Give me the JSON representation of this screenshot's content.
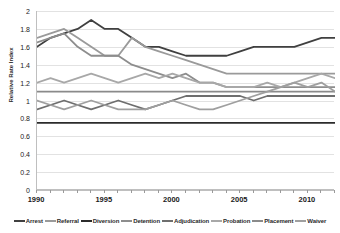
{
  "chart_data": {
    "type": "line",
    "title": "",
    "xlabel": "",
    "ylabel": "Relative Rate Index",
    "ylim": [
      0,
      2
    ],
    "xlim": [
      1990,
      2012
    ],
    "grid": true,
    "legend_position": "bottom",
    "y_ticks": [
      "0",
      "0.2",
      "0.4",
      "0.6",
      "0.8",
      "1",
      "1.2",
      "1.4",
      "1.6",
      "1.8",
      "2"
    ],
    "y_tick_values": [
      0,
      0.2,
      0.4,
      0.6,
      0.8,
      1,
      1.2,
      1.4,
      1.6,
      1.8,
      2
    ],
    "x_ticks": [
      "1990",
      "1995",
      "2000",
      "2005",
      "2010"
    ],
    "x_tick_values": [
      1990,
      1995,
      2000,
      2005,
      2010
    ],
    "x": [
      1990,
      1991,
      1992,
      1993,
      1994,
      1995,
      1996,
      1997,
      1998,
      1999,
      2000,
      2001,
      2002,
      2003,
      2004,
      2005,
      2006,
      2007,
      2008,
      2009,
      2010,
      2011,
      2012
    ],
    "series": [
      {
        "name": "Arrest",
        "color": "#404040",
        "values": [
          1.6,
          1.7,
          1.75,
          1.8,
          1.9,
          1.8,
          1.8,
          1.7,
          1.6,
          1.6,
          1.55,
          1.5,
          1.5,
          1.5,
          1.5,
          1.55,
          1.6,
          1.6,
          1.6,
          1.6,
          1.65,
          1.7,
          1.7
        ]
      },
      {
        "name": "Referral",
        "color": "#9a9a9a",
        "values": [
          1.7,
          1.75,
          1.8,
          1.7,
          1.6,
          1.5,
          1.5,
          1.7,
          1.6,
          1.55,
          1.5,
          1.45,
          1.4,
          1.35,
          1.3,
          1.3,
          1.3,
          1.3,
          1.3,
          1.3,
          1.3,
          1.3,
          1.3
        ]
      },
      {
        "name": "Diversion",
        "color": "#2b2b2b",
        "values": [
          0.75,
          0.75,
          0.75,
          0.75,
          0.75,
          0.75,
          0.75,
          0.75,
          0.75,
          0.75,
          0.75,
          0.75,
          0.75,
          0.75,
          0.75,
          0.75,
          0.75,
          0.75,
          0.75,
          0.75,
          0.75,
          0.75,
          0.75
        ]
      },
      {
        "name": "Detention",
        "color": "#8d8d8d",
        "values": [
          1.65,
          1.7,
          1.75,
          1.6,
          1.5,
          1.5,
          1.5,
          1.4,
          1.35,
          1.3,
          1.25,
          1.3,
          1.2,
          1.2,
          1.15,
          1.15,
          1.15,
          1.15,
          1.15,
          1.15,
          1.15,
          1.15,
          1.15
        ]
      },
      {
        "name": "Adjudication",
        "color": "#6e6e6e",
        "values": [
          0.9,
          0.95,
          1.0,
          0.95,
          0.9,
          0.95,
          1.0,
          0.95,
          0.9,
          0.95,
          1.0,
          1.05,
          1.05,
          1.05,
          1.05,
          1.05,
          1.0,
          1.05,
          1.05,
          1.05,
          1.05,
          1.05,
          1.05
        ]
      },
      {
        "name": "Probation",
        "color": "#a8a8a8",
        "values": [
          1.2,
          1.25,
          1.2,
          1.25,
          1.3,
          1.25,
          1.2,
          1.25,
          1.3,
          1.25,
          1.3,
          1.25,
          1.2,
          1.2,
          1.15,
          1.15,
          1.15,
          1.2,
          1.15,
          1.2,
          1.25,
          1.3,
          1.25
        ]
      },
      {
        "name": "Placement",
        "color": "#8a8a8a",
        "values": [
          1.1,
          1.1,
          1.1,
          1.1,
          1.1,
          1.1,
          1.1,
          1.1,
          1.1,
          1.1,
          1.1,
          1.1,
          1.1,
          1.1,
          1.1,
          1.1,
          1.1,
          1.1,
          1.1,
          1.1,
          1.1,
          1.1,
          1.1
        ]
      },
      {
        "name": "Waiver",
        "color": "#9f9f9f",
        "values": [
          1.0,
          0.95,
          0.9,
          0.95,
          1.0,
          0.95,
          0.9,
          0.9,
          0.9,
          0.95,
          1.0,
          0.95,
          0.9,
          0.9,
          0.95,
          1.0,
          1.05,
          1.1,
          1.15,
          1.2,
          1.15,
          1.2,
          1.1
        ]
      }
    ]
  }
}
